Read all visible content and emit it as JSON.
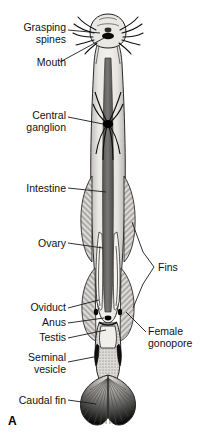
{
  "figure": {
    "panel_label": "A",
    "organism_view": "arrow worm (chaetognath) whole-body internal anatomy, dorsal view",
    "background_color": "#ffffff",
    "ink_color": "#000000"
  },
  "labels": [
    {
      "id": "grasping-spines",
      "text": "Grasping\nspines",
      "align": "right",
      "x": 6,
      "y": 22,
      "w": 60
    },
    {
      "id": "mouth",
      "text": "Mouth",
      "align": "right",
      "x": 6,
      "y": 57,
      "w": 60
    },
    {
      "id": "central-ganglion",
      "text": "Central\nganglion",
      "align": "right",
      "x": 4,
      "y": 110,
      "w": 62
    },
    {
      "id": "intestine",
      "text": "Intestine",
      "align": "right",
      "x": 4,
      "y": 183,
      "w": 62
    },
    {
      "id": "ovary",
      "text": "Ovary",
      "align": "right",
      "x": 4,
      "y": 238,
      "w": 62
    },
    {
      "id": "fins",
      "text": "Fins",
      "align": "left",
      "x": 158,
      "y": 262,
      "w": 50
    },
    {
      "id": "oviduct",
      "text": "Oviduct",
      "align": "right",
      "x": 4,
      "y": 304,
      "w": 62
    },
    {
      "id": "anus",
      "text": "Anus",
      "align": "right",
      "x": 4,
      "y": 319,
      "w": 62
    },
    {
      "id": "testis",
      "text": "Testis",
      "align": "right",
      "x": 4,
      "y": 334,
      "w": 62
    },
    {
      "id": "female-gonopore",
      "text": "Female\ngonopore",
      "align": "left",
      "x": 148,
      "y": 326,
      "w": 62
    },
    {
      "id": "seminal-vesicle",
      "text": "Seminal\nvesicle",
      "align": "right",
      "x": 4,
      "y": 352,
      "w": 62
    },
    {
      "id": "caudal-fin",
      "text": "Caudal fin",
      "align": "right",
      "x": 4,
      "y": 396,
      "w": 62
    }
  ],
  "panel": {
    "letter": "A",
    "x": 8,
    "y": 414
  },
  "colors": {
    "outline": "#1a1a1a",
    "body_light": "#e8e7e3",
    "body_mid": "#b9b8b4",
    "intestine_dark": "#6b6a6a",
    "intestine_core": "#4f4e4e",
    "fin_hatch": "#8d8c89",
    "organ_pale": "#f2f1ee",
    "black": "#000000",
    "leader_line": "#222222"
  },
  "structures": [
    {
      "name": "head-capsule",
      "note": "rounded head with grasping spines radiating both sides and dark mouth"
    },
    {
      "name": "grasping-spines",
      "note": "curved bristles, 5 per side"
    },
    {
      "name": "mouth",
      "note": "dark ventral opening on head"
    },
    {
      "name": "central-ganglion",
      "note": "black star/spider-shaped nerve mass mid-trunk with radiating nerves"
    },
    {
      "name": "intestine",
      "note": "dark gray straight tube running the body axis"
    },
    {
      "name": "ovary",
      "note": "paired pale elongate organs flanking intestine in posterior trunk"
    },
    {
      "name": "oviduct",
      "note": "narrow duct lateral to ovary"
    },
    {
      "name": "lateral-fins",
      "note": "paired hatched lateral fins, anterior and posterior pairs"
    },
    {
      "name": "anus",
      "note": "dark spot at trunk-tail septum"
    },
    {
      "name": "female-gonopore",
      "note": "opening at lateral posterior trunk"
    },
    {
      "name": "testis",
      "note": "stippled tissue in tail segment"
    },
    {
      "name": "seminal-vesicle",
      "note": "dark paired swellings on tail sides"
    },
    {
      "name": "caudal-fin",
      "note": "fan-shaped hatched terminal fin with radiating rays"
    }
  ]
}
